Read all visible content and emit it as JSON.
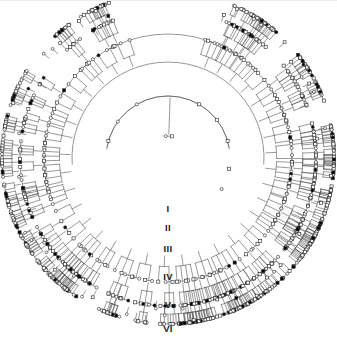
{
  "figure": {
    "type": "circular-pedigree-chart",
    "background_color": "#ffffff",
    "line_color": "#555555",
    "symbol_stroke_color": "#333333",
    "affected_fill": "#000000",
    "unaffected_fill": "#ffffff",
    "width": 337,
    "height": 354
  },
  "legend_semantics": {
    "square": "male",
    "circle": "female",
    "filled": "affected",
    "open": "unaffected"
  },
  "generation_labels": [
    {
      "label": "I",
      "top": 203
    },
    {
      "label": "II",
      "top": 222
    },
    {
      "label": "III",
      "top": 243
    },
    {
      "label": "IV",
      "top": 271
    },
    {
      "label": "V",
      "top": 299
    },
    {
      "label": "VI",
      "top": 323
    }
  ],
  "geometry": {
    "center_x": 168,
    "center_y": 158,
    "generation_radii": [
      22,
      62,
      96,
      124,
      148,
      166
    ],
    "gap_start_deg": 255,
    "gap_end_deg": 285,
    "arc_rings": [
      {
        "generation": 2,
        "radius": 62,
        "start_deg": 188,
        "end_deg": 352
      },
      {
        "generation": 3,
        "radius": 96,
        "start_deg": 176,
        "end_deg": 364
      },
      {
        "generation": 4,
        "radius": 124,
        "start_deg": 170,
        "end_deg": 370
      }
    ]
  },
  "chart_data": {
    "type": "diagram",
    "generations": 6,
    "founder_couple": {
      "male_id": "I-1",
      "female_id": "I-2"
    },
    "nodes": [
      {
        "id": "I-1",
        "sex": "male",
        "affected": false,
        "gen": 1,
        "angle": 284,
        "r": 22
      },
      {
        "id": "I-2",
        "sex": "female",
        "affected": false,
        "gen": 1,
        "angle": 276,
        "r": 22
      },
      {
        "id": "II-1",
        "sex": "male",
        "affected": false,
        "gen": 2,
        "angle": 274,
        "r": 62
      },
      {
        "id": "II-2",
        "sex": "female",
        "affected": false,
        "gen": 2,
        "angle": 268,
        "r": 62
      },
      {
        "id": "II-3",
        "sex": "female",
        "affected": false,
        "gen": 2,
        "angle": 318,
        "r": 62
      },
      {
        "id": "II-4",
        "sex": "male",
        "affected": false,
        "gen": 2,
        "angle": 326,
        "r": 62
      },
      {
        "id": "II-5",
        "sex": "female",
        "affected": false,
        "gen": 2,
        "angle": 196,
        "r": 62
      },
      {
        "id": "II-6",
        "sex": "male",
        "affected": false,
        "gen": 2,
        "angle": 203,
        "r": 62
      },
      {
        "id": "II-7",
        "sex": "male",
        "affected": false,
        "gen": 2,
        "angle": 350,
        "r": 62
      },
      {
        "id": "II-8",
        "sex": "female",
        "affected": false,
        "gen": 2,
        "angle": 357,
        "r": 62
      }
    ],
    "counts": {
      "total_individuals": 212,
      "affected_total": 34,
      "affected_males": 13,
      "affected_females": 21
    }
  }
}
